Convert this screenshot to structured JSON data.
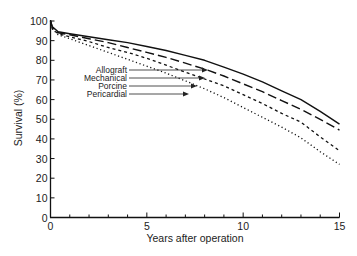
{
  "chart_data": {
    "type": "line",
    "title": "",
    "xlabel": "Years after operation",
    "ylabel": "Survival (%)",
    "xlim": [
      0,
      15
    ],
    "ylim": [
      0,
      100
    ],
    "x_ticks_major": [
      0,
      5,
      10,
      15
    ],
    "x_ticks_minor_step": 1,
    "y_ticks": [
      0,
      10,
      20,
      30,
      40,
      50,
      60,
      70,
      80,
      90,
      100
    ],
    "grid": false,
    "legend": "inline labels with arrows",
    "x": [
      0,
      0.1,
      0.4,
      1,
      2,
      3,
      4,
      5,
      6,
      7,
      8,
      9,
      10,
      11,
      12,
      13,
      14,
      15
    ],
    "series": [
      {
        "name": "Allograft",
        "style": "solid",
        "values": [
          100,
          97,
          94.5,
          93.5,
          92,
          90.5,
          89,
          87,
          85,
          82.5,
          80,
          76.5,
          73,
          69,
          64.5,
          60,
          54,
          47.5
        ]
      },
      {
        "name": "Mechanical",
        "style": "long-dash",
        "values": [
          100,
          96.5,
          94,
          93,
          91,
          89,
          86.5,
          84,
          81.5,
          78.5,
          75.5,
          72,
          68,
          64,
          59.5,
          55,
          50,
          44.5
        ]
      },
      {
        "name": "Porcine",
        "style": "short-dash",
        "values": [
          100,
          96,
          93.5,
          92,
          89.5,
          86.5,
          84,
          81,
          77.5,
          74,
          70.5,
          67,
          62.5,
          58,
          53,
          48.5,
          41,
          34
        ]
      },
      {
        "name": "Pericardial",
        "style": "dotted",
        "values": [
          100,
          96,
          93,
          91,
          87.5,
          84,
          80.5,
          77,
          73.5,
          69.5,
          65.5,
          61,
          56,
          51,
          46,
          40.5,
          33.5,
          27
        ]
      }
    ],
    "annotations": [
      {
        "text": "Allograft",
        "arrow_to_series": "Allograft"
      },
      {
        "text": "Mechanical",
        "arrow_to_series": "Mechanical"
      },
      {
        "text": "Porcine",
        "arrow_to_series": "Porcine"
      },
      {
        "text": "Pericardial",
        "arrow_to_series": "Pericardial"
      }
    ]
  }
}
